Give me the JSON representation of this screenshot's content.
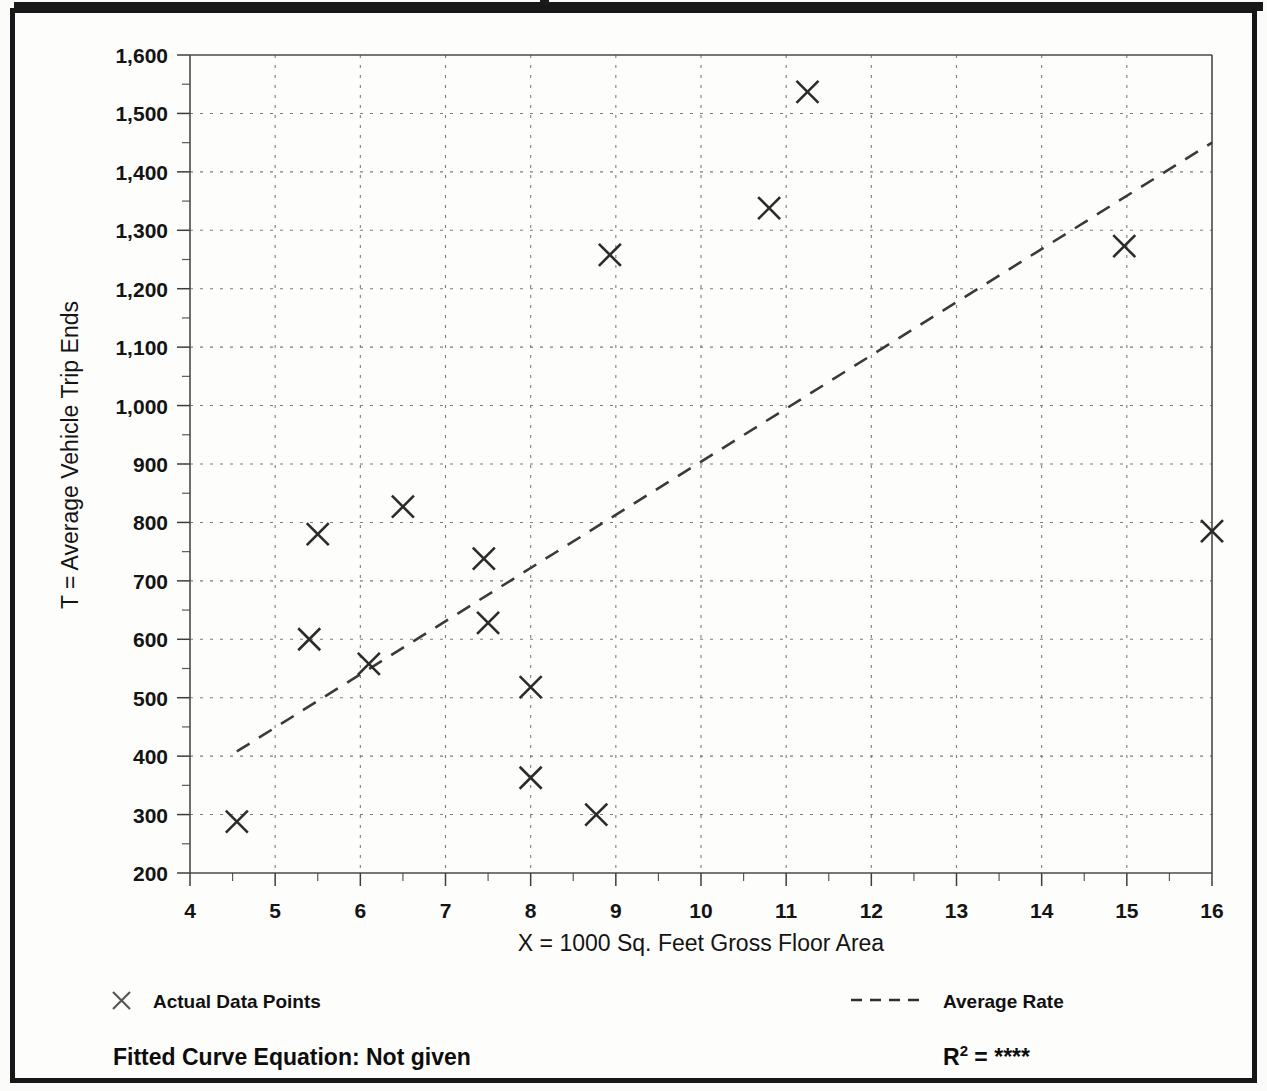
{
  "chart_data": {
    "type": "scatter",
    "title": "",
    "xlabel": "X = 1000 Sq. Feet Gross Floor Area",
    "ylabel": "T = Average Vehicle Trip Ends",
    "xlim": [
      4,
      16
    ],
    "ylim": [
      200,
      1600
    ],
    "x_major_step": 1,
    "x_minor_step": 0.5,
    "y_major_step": 100,
    "y_minor_step": 50,
    "grid": true,
    "legend_position": "below-plot",
    "x_tick_labels": [
      "4",
      "5",
      "6",
      "7",
      "8",
      "9",
      "10",
      "11",
      "12",
      "13",
      "14",
      "15",
      "16"
    ],
    "y_tick_labels": [
      "200",
      "300",
      "400",
      "500",
      "600",
      "700",
      "800",
      "900",
      "1,000",
      "1,100",
      "1,200",
      "1,300",
      "1,400",
      "1,500",
      "1,600"
    ],
    "series": [
      {
        "name": "Actual Data Points",
        "marker": "x-cross",
        "points": [
          {
            "x": 4.55,
            "y": 288
          },
          {
            "x": 5.4,
            "y": 600
          },
          {
            "x": 5.5,
            "y": 780
          },
          {
            "x": 6.1,
            "y": 558
          },
          {
            "x": 6.5,
            "y": 827
          },
          {
            "x": 7.45,
            "y": 738
          },
          {
            "x": 7.5,
            "y": 628
          },
          {
            "x": 8.0,
            "y": 518
          },
          {
            "x": 8.0,
            "y": 363
          },
          {
            "x": 8.77,
            "y": 300
          },
          {
            "x": 8.93,
            "y": 1258
          },
          {
            "x": 10.8,
            "y": 1338
          },
          {
            "x": 11.25,
            "y": 1537
          },
          {
            "x": 14.97,
            "y": 1273
          },
          {
            "x": 16.0,
            "y": 785
          }
        ]
      }
    ],
    "trend_line": {
      "name": "Average Rate",
      "style": "dashed",
      "start": {
        "x": 4.55,
        "y": 408
      },
      "end": {
        "x": 16.0,
        "y": 1450
      }
    }
  },
  "legend": {
    "data_points_label": "Actual Data Points",
    "average_rate_label": "Average Rate",
    "data_points_marker": "x-cross-icon",
    "average_rate_marker": "dashed-line-icon"
  },
  "footer": {
    "fitted_curve_equation": "Fitted Curve Equation:  Not given",
    "r2_base": "R",
    "r2_sup": "2",
    "r2_equals": " = ",
    "r2_value": "****"
  },
  "colors": {
    "ink": "#141414",
    "grid": "#7d7d7d",
    "axis": "#4a4a4a",
    "page": "#fdfdfc",
    "frame": "#17171a"
  }
}
